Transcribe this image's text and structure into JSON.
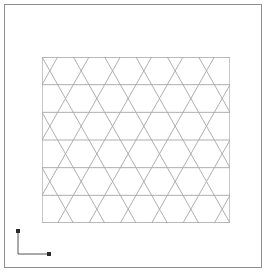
{
  "window": {
    "title": "Triangular Mesh Viewport",
    "background_color": "#ffffff",
    "frame_color": "#8e8e8e"
  },
  "mesh": {
    "name": "triangular-lattice-mesh",
    "description": "Structured triangulated mesh of equilateral triangles",
    "line_color": "#a6a6a6",
    "border_color": "#8e8e8e",
    "fill_color": "#ffffff",
    "rows": 6,
    "columns": 6,
    "cell_width": 31.3,
    "cell_height": 27.6,
    "origin_x": 37,
    "origin_y": 52,
    "width": 188,
    "height": 166,
    "element_type": "triangle",
    "element_count": 72,
    "node_count": 49
  },
  "axis_widget": {
    "name": "coordinate-axis-indicator",
    "x_label": "X",
    "y_label": "Y",
    "line_color": "#555555",
    "marker_color": "#222222"
  }
}
